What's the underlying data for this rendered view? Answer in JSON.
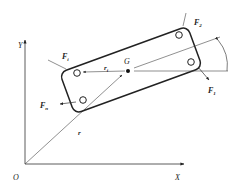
{
  "diagram": {
    "title": "",
    "axes": {
      "origin_label": "O",
      "x_label": "X",
      "y_label": "Y"
    },
    "centroid_label": "G",
    "position_vector_label": "r",
    "relative_vector": {
      "main": "r",
      "sub": "i"
    },
    "forces": [
      {
        "id": "F1",
        "main": "F",
        "sub": "1"
      },
      {
        "id": "F2",
        "main": "F",
        "sub": "2"
      },
      {
        "id": "Fi",
        "main": "F",
        "sub": "i"
      },
      {
        "id": "Fn",
        "main": "F",
        "sub": "n"
      }
    ],
    "colors": {
      "line": "#222222",
      "thin_line": "#444444",
      "background": "#ffffff"
    }
  }
}
